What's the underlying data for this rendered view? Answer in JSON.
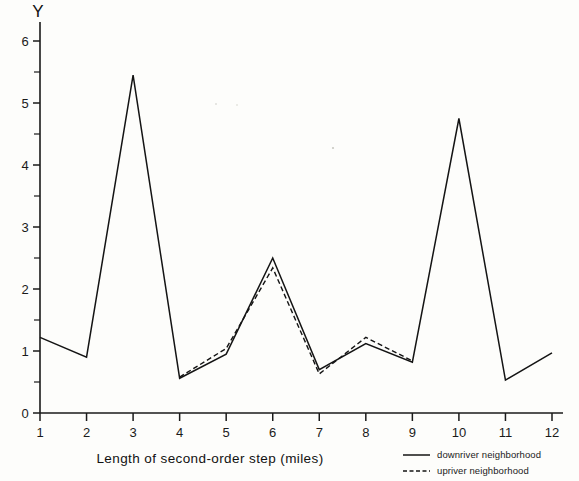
{
  "chart_data": {
    "type": "line",
    "title": "",
    "xlabel": "Length of second-order step (miles)",
    "ylabel": "Y",
    "xlim": [
      1,
      12
    ],
    "ylim": [
      0,
      6.3
    ],
    "grid": false,
    "legend_position": "bottom-right",
    "x": [
      1,
      2,
      3,
      4,
      5,
      6,
      7,
      8,
      9,
      10,
      11,
      12
    ],
    "xticks": [
      "1",
      "2",
      "3",
      "4",
      "5",
      "6",
      "7",
      "8",
      "9",
      "10",
      "11",
      "12"
    ],
    "yticks": [
      "0",
      "1",
      "2",
      "3",
      "4",
      "5",
      "6"
    ],
    "yticks_minor": [
      0.5,
      1.5,
      2.5,
      3.5,
      4.5,
      5.5
    ],
    "series": [
      {
        "name": "downriver neighborhood",
        "style": "solid",
        "x": [
          1,
          2,
          3,
          4,
          5,
          6,
          7,
          8,
          9,
          10,
          11,
          12
        ],
        "values": [
          1.22,
          0.9,
          5.45,
          0.56,
          0.95,
          2.5,
          0.7,
          1.12,
          0.82,
          4.75,
          0.53,
          0.97
        ]
      },
      {
        "name": "upriver neighborhood",
        "style": "dashed",
        "x": [
          4,
          5,
          6,
          7,
          8,
          9
        ],
        "values": [
          0.58,
          1.04,
          2.34,
          0.63,
          1.22,
          0.84
        ]
      }
    ]
  },
  "legend": {
    "items": [
      {
        "label": "downriver neighborhood",
        "style": "solid"
      },
      {
        "label": "upriver neighborhood",
        "style": "dashed"
      }
    ]
  }
}
